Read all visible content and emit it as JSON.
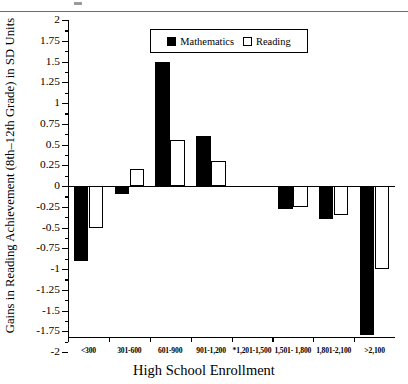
{
  "chart_data": {
    "type": "bar",
    "title": "",
    "xlabel": "High School Enrollment",
    "ylabel": "Gains in Reading Achievement (8th–12th Grade) in SD Units",
    "categories": [
      "<300",
      "301-600",
      "601-900",
      "901-1,200",
      "*1,201-1,500",
      "1,501- 1,800",
      "1,801-2,100",
      ">2,100"
    ],
    "series": [
      {
        "name": "Mathematics",
        "color": "#000000",
        "values": [
          -0.9,
          -0.1,
          1.5,
          0.6,
          null,
          -0.28,
          -0.4,
          -1.8
        ]
      },
      {
        "name": "Reading",
        "color": "#ffffff",
        "values": [
          -0.5,
          0.2,
          0.55,
          0.3,
          null,
          -0.25,
          -0.35,
          -1.0
        ]
      }
    ],
    "ylim": [
      -2,
      2
    ],
    "ytick_labels": [
      "2",
      "1.75",
      "1.5",
      "1.25",
      "1",
      "0.75",
      "0.5",
      "0.25",
      "0",
      "-0.25",
      "-0.5",
      "-0.75",
      "-1",
      "-1.25",
      "-1.5",
      "-1.75",
      "-2"
    ],
    "ytick_values": [
      2,
      1.75,
      1.5,
      1.25,
      1,
      0.75,
      0.5,
      0.25,
      0,
      -0.25,
      -0.5,
      -0.75,
      -1,
      -1.25,
      -1.5,
      -1.75,
      -2
    ],
    "grid": false,
    "legend": {
      "position": "top-center",
      "entries": [
        "Mathematics",
        "Reading"
      ]
    }
  }
}
